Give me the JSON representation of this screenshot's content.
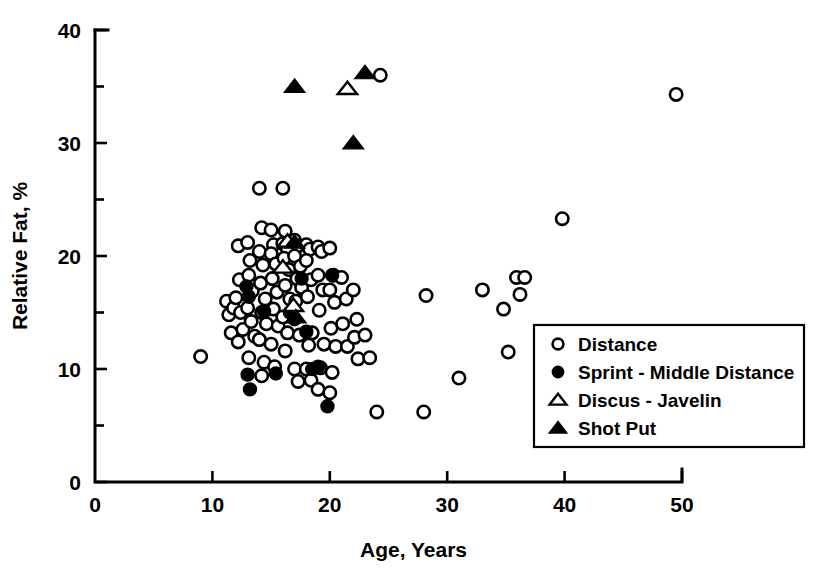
{
  "chart_data": {
    "type": "scatter",
    "title": "",
    "xlabel": "Age, Years",
    "ylabel": "Relative Fat, %",
    "xlim": [
      0,
      50
    ],
    "ylim": [
      0,
      40
    ],
    "xticks": [
      0,
      10,
      20,
      30,
      40,
      50
    ],
    "yticks": [
      0,
      10,
      20,
      30,
      40
    ],
    "xminorticks": [
      5,
      15,
      25,
      35,
      45
    ],
    "yminorticks": [
      5,
      15,
      25,
      35
    ],
    "grid": false,
    "legend_position": "bottom-right",
    "series": [
      {
        "name": "Distance",
        "marker": "open-circle",
        "color": "#000000",
        "points": [
          [
            9.0,
            11.1
          ],
          [
            11.2,
            16.0
          ],
          [
            11.4,
            14.8
          ],
          [
            11.8,
            15.4
          ],
          [
            11.6,
            13.2
          ],
          [
            12.2,
            20.9
          ],
          [
            12.3,
            17.9
          ],
          [
            12.0,
            16.3
          ],
          [
            12.4,
            15.0
          ],
          [
            12.6,
            13.5
          ],
          [
            12.2,
            12.4
          ],
          [
            13.0,
            21.2
          ],
          [
            13.2,
            19.6
          ],
          [
            13.1,
            18.3
          ],
          [
            13.4,
            16.9
          ],
          [
            13.0,
            15.4
          ],
          [
            13.3,
            14.2
          ],
          [
            13.6,
            12.9
          ],
          [
            13.1,
            11.0
          ],
          [
            14.0,
            26.0
          ],
          [
            14.2,
            22.5
          ],
          [
            14.0,
            20.4
          ],
          [
            14.3,
            19.2
          ],
          [
            14.1,
            17.6
          ],
          [
            14.5,
            16.2
          ],
          [
            14.2,
            15.0
          ],
          [
            14.6,
            14.0
          ],
          [
            14.0,
            12.6
          ],
          [
            14.4,
            10.6
          ],
          [
            14.2,
            9.4
          ],
          [
            15.0,
            22.3
          ],
          [
            15.2,
            21.0
          ],
          [
            15.0,
            20.2
          ],
          [
            15.4,
            19.3
          ],
          [
            15.1,
            18.0
          ],
          [
            15.5,
            16.8
          ],
          [
            15.2,
            15.3
          ],
          [
            15.6,
            13.8
          ],
          [
            15.0,
            12.2
          ],
          [
            15.3,
            10.2
          ],
          [
            16.0,
            26.0
          ],
          [
            16.2,
            22.2
          ],
          [
            16.0,
            21.1
          ],
          [
            16.4,
            20.6
          ],
          [
            16.1,
            19.8
          ],
          [
            16.5,
            18.8
          ],
          [
            16.2,
            17.4
          ],
          [
            16.6,
            16.2
          ],
          [
            16.0,
            14.6
          ],
          [
            16.4,
            13.2
          ],
          [
            16.2,
            11.6
          ],
          [
            17.0,
            21.4
          ],
          [
            17.3,
            20.9
          ],
          [
            17.0,
            20.0
          ],
          [
            17.5,
            19.1
          ],
          [
            17.2,
            18.0
          ],
          [
            17.6,
            17.2
          ],
          [
            17.1,
            16.0
          ],
          [
            17.4,
            13.0
          ],
          [
            17.0,
            10.0
          ],
          [
            17.3,
            8.9
          ],
          [
            18.0,
            21.0
          ],
          [
            18.3,
            20.6
          ],
          [
            18.0,
            19.6
          ],
          [
            18.4,
            17.9
          ],
          [
            18.1,
            16.4
          ],
          [
            18.5,
            13.2
          ],
          [
            18.2,
            12.1
          ],
          [
            18.0,
            10.0
          ],
          [
            18.4,
            9.0
          ],
          [
            19.0,
            20.8
          ],
          [
            19.3,
            20.4
          ],
          [
            19.0,
            18.3
          ],
          [
            19.4,
            17.0
          ],
          [
            19.1,
            15.2
          ],
          [
            19.5,
            12.2
          ],
          [
            19.2,
            10.1
          ],
          [
            19.0,
            8.2
          ],
          [
            20.0,
            20.7
          ],
          [
            20.3,
            18.3
          ],
          [
            20.0,
            17.0
          ],
          [
            20.4,
            15.9
          ],
          [
            20.1,
            13.6
          ],
          [
            20.5,
            12.0
          ],
          [
            20.2,
            9.7
          ],
          [
            20.0,
            7.9
          ],
          [
            21.0,
            18.1
          ],
          [
            21.4,
            16.2
          ],
          [
            21.1,
            14.0
          ],
          [
            21.5,
            12.0
          ],
          [
            22.0,
            17.0
          ],
          [
            22.3,
            14.4
          ],
          [
            22.1,
            12.8
          ],
          [
            22.4,
            10.9
          ],
          [
            23.0,
            13.0
          ],
          [
            23.4,
            11.0
          ],
          [
            24.3,
            36.0
          ],
          [
            24.0,
            6.2
          ],
          [
            28.0,
            6.2
          ],
          [
            28.2,
            16.5
          ],
          [
            31.0,
            9.2
          ],
          [
            33.0,
            17.0
          ],
          [
            34.8,
            15.3
          ],
          [
            35.2,
            11.5
          ],
          [
            35.9,
            18.1
          ],
          [
            36.6,
            18.1
          ],
          [
            36.2,
            16.6
          ],
          [
            39.8,
            23.3
          ],
          [
            49.5,
            34.3
          ]
        ]
      },
      {
        "name": "Sprint - Middle Distance",
        "marker": "filled-circle",
        "color": "#000000",
        "points": [
          [
            12.9,
            17.3
          ],
          [
            13.1,
            16.4
          ],
          [
            13.0,
            9.5
          ],
          [
            13.2,
            8.2
          ],
          [
            14.4,
            15.1
          ],
          [
            15.4,
            9.6
          ],
          [
            16.6,
            15.0
          ],
          [
            17.0,
            14.4
          ],
          [
            17.6,
            18.0
          ],
          [
            18.0,
            13.3
          ],
          [
            18.5,
            10.0
          ],
          [
            19.0,
            10.2
          ],
          [
            19.8,
            6.7
          ],
          [
            20.2,
            18.3
          ]
        ]
      },
      {
        "name": "Discus - Javelin",
        "marker": "open-triangle",
        "color": "#000000",
        "points": [
          [
            16.4,
            21.3
          ],
          [
            16.0,
            19.0
          ],
          [
            16.9,
            15.6
          ],
          [
            21.5,
            34.8
          ]
        ]
      },
      {
        "name": "Shot Put",
        "marker": "filled-triangle",
        "color": "#000000",
        "points": [
          [
            17.0,
            35.0
          ],
          [
            23.0,
            36.2
          ],
          [
            22.0,
            30.0
          ],
          [
            17.0,
            21.2
          ],
          [
            17.1,
            14.6
          ]
        ]
      }
    ]
  },
  "axes": {
    "x_title": "Age, Years",
    "y_title": "Relative Fat, %",
    "x_tick_labels": [
      "0",
      "10",
      "20",
      "30",
      "40",
      "50"
    ],
    "y_tick_labels": [
      "0",
      "10",
      "20",
      "30",
      "40"
    ]
  },
  "legend": {
    "items": [
      {
        "label": "Distance",
        "marker": "open-circle"
      },
      {
        "label": "Sprint - Middle Distance",
        "marker": "filled-circle"
      },
      {
        "label": "Discus - Javelin",
        "marker": "open-triangle"
      },
      {
        "label": "Shot Put",
        "marker": "filled-triangle"
      }
    ]
  }
}
